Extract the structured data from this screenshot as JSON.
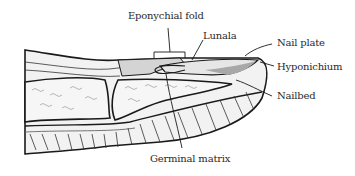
{
  "diagram": {
    "labels": [
      {
        "id": "eponychial_fold",
        "text": "Eponychial fold"
      },
      {
        "id": "lunala",
        "text": "Lunala"
      },
      {
        "id": "nail_plate",
        "text": "Nail plate"
      },
      {
        "id": "hyponichium",
        "text": "Hyponichium"
      },
      {
        "id": "nailbed",
        "text": "Nailbed"
      },
      {
        "id": "germinal_matrix",
        "text": "Germinal matrix"
      }
    ],
    "colors": {
      "outline": "#1a1a1a",
      "fill_light": "#eeeeee",
      "fill_mid": "#d4d4d4",
      "fill_dark": "#a8a8a8",
      "label_text": "#2a2a2a"
    }
  }
}
